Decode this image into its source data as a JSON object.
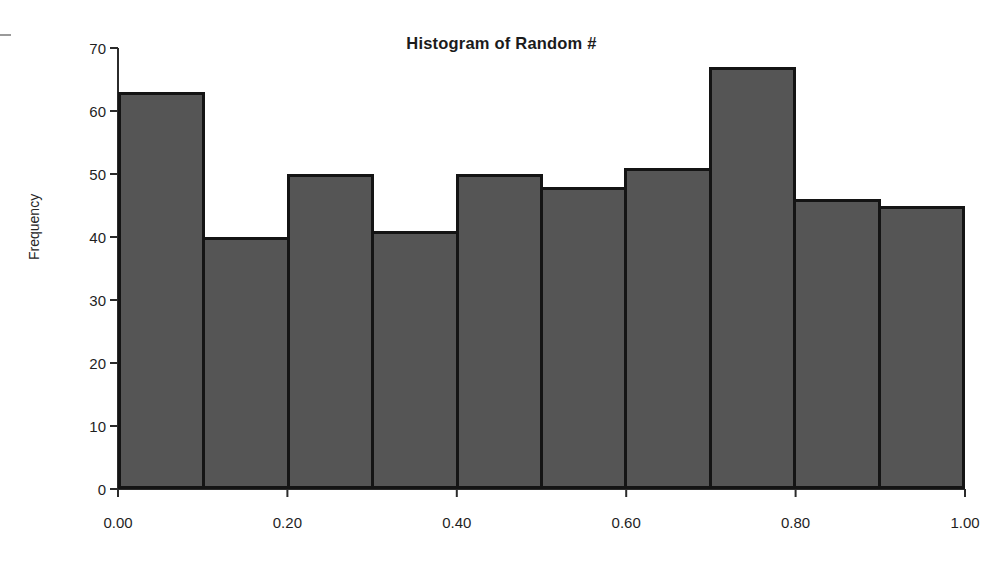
{
  "chart_data": {
    "type": "bar",
    "title": "Histogram of Random #",
    "xlabel": "",
    "ylabel": "Frequency",
    "categories": [
      "0.00-0.10",
      "0.10-0.20",
      "0.20-0.30",
      "0.30-0.40",
      "0.40-0.50",
      "0.50-0.60",
      "0.60-0.70",
      "0.70-0.80",
      "0.80-0.90",
      "0.90-1.00"
    ],
    "values": [
      63,
      40,
      50,
      41,
      50,
      48,
      51,
      67,
      46,
      45
    ],
    "bin_edges": [
      0.0,
      0.1,
      0.2,
      0.3,
      0.4,
      0.5,
      0.6,
      0.7,
      0.8,
      0.9,
      1.0
    ],
    "ylim": [
      0,
      70
    ],
    "xlim": [
      0.0,
      1.0
    ],
    "ytick_labels": [
      "0",
      "10",
      "20",
      "30",
      "40",
      "50",
      "60",
      "70"
    ],
    "ytick_values": [
      0,
      10,
      20,
      30,
      40,
      50,
      60,
      70
    ],
    "xtick_labels": [
      "0.00",
      "0.20",
      "0.40",
      "0.60",
      "0.80",
      "1.00"
    ],
    "xtick_values": [
      0.0,
      0.2,
      0.4,
      0.6,
      0.8,
      1.0
    ],
    "grid": false,
    "legend": null,
    "bar_fill_color": "#555555",
    "bar_edge_color": "#141414",
    "background_color": "#ffffff"
  }
}
